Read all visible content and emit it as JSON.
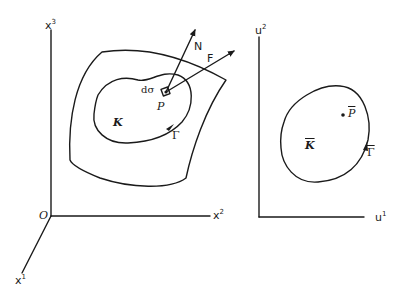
{
  "left_panel": {
    "axes": {
      "x1": {
        "label": "x",
        "sup": "1"
      },
      "x2": {
        "label": "x",
        "sup": "2"
      },
      "x3": {
        "label": "x",
        "sup": "3"
      },
      "origin": "O"
    },
    "surface_labels": {
      "normal": "N",
      "force": "F",
      "area_element": "dσ",
      "point": "P",
      "region": "K",
      "boundary": "Γ"
    }
  },
  "right_panel": {
    "axes": {
      "u1": {
        "label": "u",
        "sup": "1"
      },
      "u2": {
        "label": "u",
        "sup": "2"
      }
    },
    "labels": {
      "point": "P",
      "region": "K",
      "boundary": "Γ"
    }
  }
}
